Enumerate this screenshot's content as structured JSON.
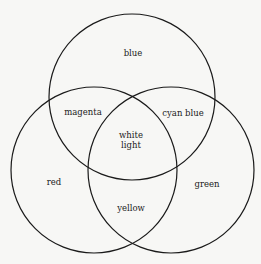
{
  "diagram": {
    "type": "venn",
    "circles": [
      {
        "name": "blue",
        "cx": 132,
        "cy": 97,
        "r": 83
      },
      {
        "name": "red",
        "cx": 94,
        "cy": 170,
        "r": 83
      },
      {
        "name": "green",
        "cx": 171,
        "cy": 170,
        "r": 83
      }
    ],
    "labels": {
      "blue": "blue",
      "magenta": "magenta",
      "cyan_blue": "cyan blue",
      "white_line1": "white",
      "white_line2": "light",
      "red": "red",
      "green": "green",
      "yellow": "yellow"
    },
    "stroke_color": "#1a1a1a",
    "background_color": "#f7f7f5"
  }
}
